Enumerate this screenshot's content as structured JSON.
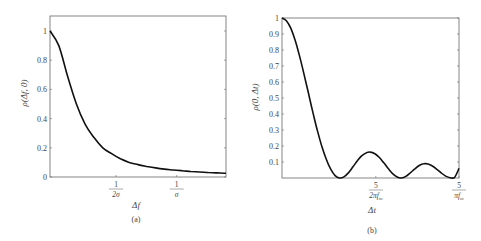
{
  "chart_data": [
    {
      "type": "line",
      "panel": "(a)",
      "title": "",
      "xlabel": "Δf",
      "ylabel": "ρ(Δf, 0)",
      "caption": "(a)",
      "ylim": [
        0,
        1.1
      ],
      "yticks": [
        "0",
        "0.2",
        "0.4",
        "0.6",
        "0.8",
        "1"
      ],
      "ytick_values": [
        0,
        0.2,
        0.4,
        0.6,
        0.8,
        1
      ],
      "xticks": [
        {
          "num": "1",
          "den": "2σ",
          "pos": 0.375
        },
        {
          "num": "1",
          "den": "σ",
          "pos": 0.72
        }
      ],
      "grid": false,
      "x": [
        0,
        0.05,
        0.1,
        0.15,
        0.2,
        0.25,
        0.3,
        0.35,
        0.4,
        0.45,
        0.5,
        0.55,
        0.6,
        0.65,
        0.7,
        0.75,
        0.8,
        0.85,
        0.9,
        0.95,
        1.0
      ],
      "values": [
        1.0,
        0.9,
        0.69,
        0.5,
        0.36,
        0.27,
        0.2,
        0.16,
        0.125,
        0.1,
        0.085,
        0.072,
        0.062,
        0.054,
        0.048,
        0.043,
        0.038,
        0.034,
        0.031,
        0.028,
        0.026
      ]
    },
    {
      "type": "line",
      "panel": "(b)",
      "title": "",
      "xlabel": "Δt",
      "ylabel": "ρ(0, Δt)",
      "caption": "(b)",
      "ylim": [
        0,
        1
      ],
      "yticks": [
        "0.1",
        "0.2",
        "0.3",
        "0.4",
        "0.5",
        "0.6",
        "0.7",
        "0.8",
        "0.9",
        "1"
      ],
      "ytick_values": [
        0.1,
        0.2,
        0.3,
        0.4,
        0.5,
        0.6,
        0.7,
        0.8,
        0.9,
        1
      ],
      "xticks": [
        {
          "num": "5",
          "den": "2πf",
          "sub": "m",
          "pos": 0.53
        },
        {
          "num": "5",
          "den": "πf",
          "sub": "m",
          "pos": 1.0
        }
      ],
      "grid": false,
      "x": [
        0,
        0.025,
        0.05,
        0.075,
        0.1,
        0.125,
        0.15,
        0.175,
        0.2,
        0.225,
        0.25,
        0.275,
        0.3,
        0.325,
        0.35,
        0.375,
        0.4,
        0.425,
        0.45,
        0.475,
        0.5,
        0.525,
        0.55,
        0.575,
        0.6,
        0.625,
        0.65,
        0.675,
        0.7,
        0.725,
        0.75,
        0.775,
        0.8,
        0.825,
        0.85,
        0.875,
        0.9,
        0.925,
        0.95,
        0.975,
        1.0
      ],
      "values": [
        1.0,
        0.983,
        0.935,
        0.858,
        0.759,
        0.646,
        0.526,
        0.407,
        0.296,
        0.198,
        0.117,
        0.055,
        0.015,
        0.0,
        0.007,
        0.032,
        0.068,
        0.106,
        0.138,
        0.157,
        0.162,
        0.152,
        0.128,
        0.095,
        0.059,
        0.027,
        0.006,
        0.0,
        0.01,
        0.032,
        0.057,
        0.078,
        0.089,
        0.088,
        0.075,
        0.054,
        0.031,
        0.012,
        0.002,
        0.004,
        0.06
      ]
    }
  ]
}
